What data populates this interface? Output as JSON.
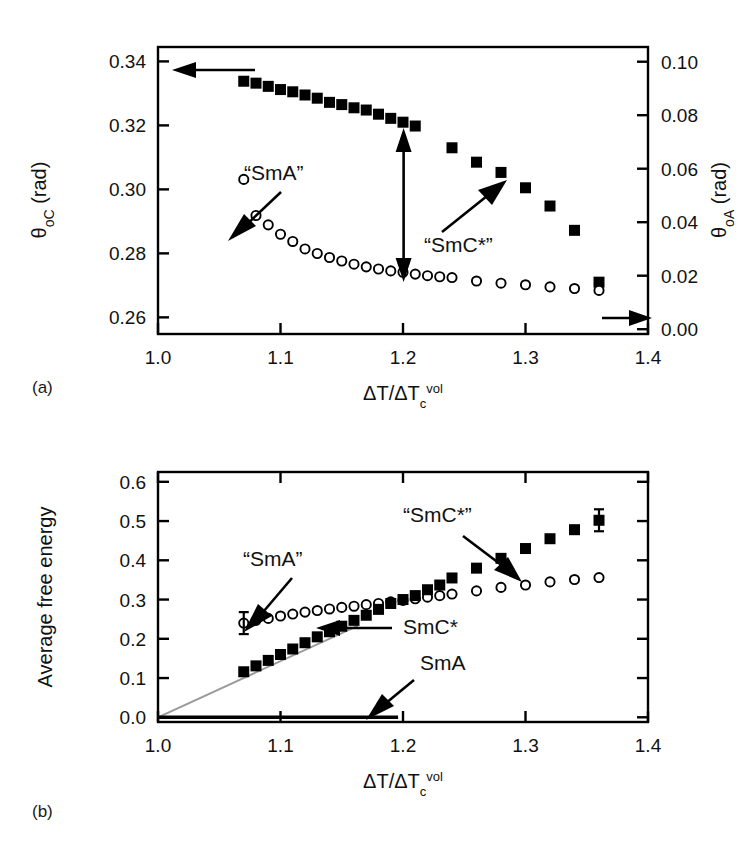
{
  "figure": {
    "panels": [
      {
        "id": "a",
        "label": "(a)",
        "xlabel": "ΔT/ΔT",
        "xlabel_sub": "c",
        "xlabel_sup": "vol",
        "ylabel_left_sym": "θ",
        "ylabel_left_sub": "oC",
        "ylabel_left_unit": " (rad)",
        "ylabel_right_sym": "θ",
        "ylabel_right_sub": "oA",
        "ylabel_right_unit": " (rad)",
        "annotations": [
          "“SmA”",
          "“SmC*”"
        ]
      },
      {
        "id": "b",
        "label": "(b)",
        "xlabel": "ΔT/ΔT",
        "xlabel_sub": "c",
        "xlabel_sup": "vol",
        "ylabel": "Average free energy",
        "annotations": [
          "“SmA”",
          "“SmC*”",
          "SmC*",
          "SmA"
        ]
      }
    ]
  },
  "chart_data": [
    {
      "type": "scatter",
      "panel": "a",
      "title": "",
      "xlabel": "ΔT/ΔTc^vol",
      "ylabel": "θoC (rad)",
      "ylabel_right": "θoA (rad)",
      "xlim": [
        1.0,
        1.4
      ],
      "ylim": [
        0.26,
        0.34
      ],
      "ylim_right": [
        0.0,
        0.1
      ],
      "xticks": [
        1.0,
        1.1,
        1.2,
        1.3,
        1.4
      ],
      "yticks": [
        0.26,
        0.28,
        0.3,
        0.32,
        0.34
      ],
      "yticks_right": [
        0.0,
        0.02,
        0.04,
        0.06,
        0.08,
        0.1
      ],
      "grid": false,
      "legend": "none",
      "series": [
        {
          "name": "θoC (filled squares, left axis)",
          "marker": "filled-square",
          "axis": "left",
          "x": [
            1.07,
            1.08,
            1.09,
            1.1,
            1.11,
            1.12,
            1.13,
            1.14,
            1.15,
            1.16,
            1.17,
            1.18,
            1.19,
            1.2,
            1.21,
            1.24,
            1.26,
            1.28,
            1.3,
            1.32,
            1.34,
            1.36
          ],
          "y": [
            0.3338,
            0.3332,
            0.3322,
            0.3312,
            0.3305,
            0.3295,
            0.3285,
            0.3272,
            0.3265,
            0.3255,
            0.3248,
            0.3235,
            0.3222,
            0.321,
            0.3198,
            0.313,
            0.3085,
            0.3053,
            0.3005,
            0.2948,
            0.2872,
            0.271
          ]
        },
        {
          "name": "θoA (open circles, right axis)",
          "marker": "open-circle",
          "axis": "right",
          "x": [
            1.07,
            1.08,
            1.09,
            1.1,
            1.11,
            1.12,
            1.13,
            1.14,
            1.15,
            1.16,
            1.17,
            1.18,
            1.19,
            1.2,
            1.21,
            1.22,
            1.23,
            1.24,
            1.26,
            1.28,
            1.3,
            1.32,
            1.34,
            1.36
          ],
          "y": [
            0.056,
            0.0425,
            0.039,
            0.0355,
            0.0328,
            0.03,
            0.0283,
            0.0268,
            0.0255,
            0.0243,
            0.0233,
            0.0225,
            0.0218,
            0.0213,
            0.0206,
            0.02,
            0.0196,
            0.0193,
            0.018,
            0.0172,
            0.0166,
            0.0158,
            0.0152,
            0.0145
          ]
        }
      ]
    },
    {
      "type": "scatter",
      "panel": "b",
      "title": "",
      "xlabel": "ΔT/ΔTc^vol",
      "ylabel": "Average free energy",
      "xlim": [
        1.0,
        1.4
      ],
      "ylim": [
        0.0,
        0.6
      ],
      "xticks": [
        1.0,
        1.1,
        1.2,
        1.3,
        1.4
      ],
      "yticks": [
        0.0,
        0.1,
        0.2,
        0.3,
        0.4,
        0.5,
        0.6
      ],
      "grid": false,
      "legend": "none",
      "series": [
        {
          "name": "“SmC*” (filled squares)",
          "marker": "filled-square",
          "x": [
            1.07,
            1.08,
            1.09,
            1.1,
            1.11,
            1.12,
            1.13,
            1.14,
            1.15,
            1.16,
            1.17,
            1.18,
            1.19,
            1.2,
            1.21,
            1.22,
            1.23,
            1.24,
            1.26,
            1.28,
            1.3,
            1.32,
            1.34,
            1.36
          ],
          "y": [
            0.116,
            0.131,
            0.145,
            0.16,
            0.174,
            0.19,
            0.205,
            0.218,
            0.232,
            0.247,
            0.26,
            0.275,
            0.29,
            0.3,
            0.31,
            0.325,
            0.337,
            0.355,
            0.38,
            0.405,
            0.43,
            0.455,
            0.478,
            0.502
          ],
          "yerr_last": 0.028
        },
        {
          "name": "“SmA” (open circles)",
          "marker": "open-circle",
          "x": [
            1.07,
            1.08,
            1.09,
            1.1,
            1.11,
            1.12,
            1.13,
            1.14,
            1.15,
            1.16,
            1.17,
            1.18,
            1.19,
            1.2,
            1.21,
            1.22,
            1.23,
            1.24,
            1.26,
            1.28,
            1.3,
            1.32,
            1.34,
            1.36
          ],
          "y": [
            0.24,
            0.247,
            0.252,
            0.258,
            0.263,
            0.268,
            0.272,
            0.276,
            0.28,
            0.283,
            0.287,
            0.29,
            0.294,
            0.298,
            0.302,
            0.306,
            0.31,
            0.314,
            0.322,
            0.331,
            0.337,
            0.345,
            0.351,
            0.356
          ],
          "yerr_first": 0.028
        },
        {
          "name": "SmC* (grey line)",
          "marker": "line",
          "color": "#9a9a9a",
          "x": [
            1.0,
            1.163
          ],
          "y": [
            0.0,
            0.233
          ]
        },
        {
          "name": "SmA (black line)",
          "marker": "line",
          "color": "#000000",
          "x": [
            1.0,
            1.196
          ],
          "y": [
            0.0,
            0.0
          ]
        }
      ]
    }
  ]
}
